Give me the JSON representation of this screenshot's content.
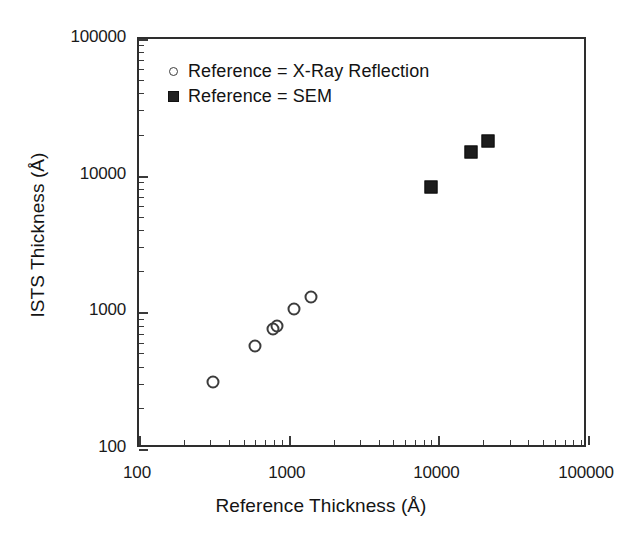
{
  "chart_data": {
    "type": "scatter",
    "title": "",
    "xlabel": "Reference Thickness (Å)",
    "ylabel": "ISTS Thickness (Å)",
    "xscale": "log",
    "yscale": "log",
    "xlim": [
      100,
      100000
    ],
    "ylim": [
      100,
      100000
    ],
    "xticks": [
      100,
      1000,
      10000,
      100000
    ],
    "yticks": [
      100,
      1000,
      10000,
      100000
    ],
    "xtick_labels": [
      "100",
      "1000",
      "10000",
      "100000"
    ],
    "ytick_labels": [
      "100",
      "1000",
      "10000",
      "100000"
    ],
    "grid": false,
    "legend_position": "upper left",
    "series": [
      {
        "name": "Reference = X-Ray Reflection",
        "marker": "open-circle",
        "color": "#3c3c3c",
        "points": [
          {
            "x": 310,
            "y": 310
          },
          {
            "x": 600,
            "y": 570
          },
          {
            "x": 790,
            "y": 760
          },
          {
            "x": 830,
            "y": 790
          },
          {
            "x": 1080,
            "y": 1050
          },
          {
            "x": 1400,
            "y": 1300
          }
        ]
      },
      {
        "name": "Reference = SEM",
        "marker": "filled-square",
        "color": "#1c1c1c",
        "points": [
          {
            "x": 9000,
            "y": 8300
          },
          {
            "x": 16500,
            "y": 15000
          },
          {
            "x": 21500,
            "y": 17800
          }
        ]
      }
    ]
  },
  "legend": {
    "entries": [
      {
        "label": "Reference = X-Ray Reflection",
        "marker": "open-circle"
      },
      {
        "label": "Reference = SEM",
        "marker": "filled-square"
      }
    ]
  }
}
